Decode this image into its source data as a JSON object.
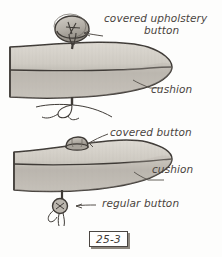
{
  "figure": {
    "number": "25-3",
    "kind": "hand-drawn upholstery cushion button diagram",
    "labels": {
      "covered_upholstery_button_line1": "covered upholstery",
      "covered_upholstery_button_line2": "button",
      "cushion_top": "cushion",
      "covered_button": "covered button",
      "cushion_bottom": "cushion",
      "regular_button": "regular button"
    },
    "colors": {
      "ink": "#3f3b37",
      "cushion_fill_light": "#d8d4cd",
      "cushion_fill_mid": "#c3bfb7",
      "cushion_fill_dark": "#a9a59d",
      "button_fill": "#b5b0a8",
      "paper": "#fdfdfc",
      "shadow": "#8e8880"
    },
    "elements": [
      {
        "name": "upper-cushion",
        "description": "tongue-shaped cushion cross section with horizontal seam"
      },
      {
        "name": "covered-upholstery-button",
        "description": "large disc button with fabric cover sitting on upper cushion"
      },
      {
        "name": "upper-thread-knot",
        "description": "loose thread ends knotted beneath upper cushion"
      },
      {
        "name": "lower-cushion",
        "description": "tongue-shaped cushion cross section with horizontal seam"
      },
      {
        "name": "small-covered-button",
        "description": "small domed covered button on top of lower cushion"
      },
      {
        "name": "regular-button",
        "description": "small round flat button with thread tails below lower cushion"
      }
    ]
  }
}
